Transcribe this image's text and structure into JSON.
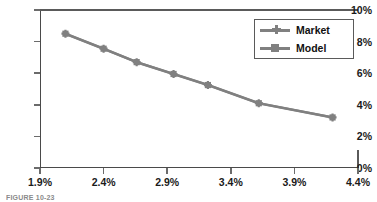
{
  "chart_data": {
    "type": "line",
    "title": "",
    "xlabel": "",
    "ylabel": "",
    "xlim": [
      1.9,
      4.4
    ],
    "ylim": [
      0,
      10
    ],
    "x_ticks": [
      "1.9%",
      "2.4%",
      "2.9%",
      "3.4%",
      "3.9%",
      "4.4%"
    ],
    "x_tick_values": [
      1.9,
      2.4,
      2.9,
      3.4,
      3.9,
      4.4
    ],
    "y_ticks": [
      "0%",
      "2%",
      "4%",
      "6%",
      "8%",
      "10%"
    ],
    "y_tick_values": [
      0,
      2,
      4,
      6,
      8,
      10
    ],
    "grid": false,
    "legend_position": "top-right",
    "x": [
      2.1,
      2.4,
      2.66,
      2.95,
      3.22,
      3.62,
      4.2
    ],
    "series": [
      {
        "name": "Market",
        "marker": "cross",
        "color": "#808080",
        "values": [
          8.5,
          7.55,
          6.7,
          5.95,
          5.25,
          4.1,
          3.2
        ]
      },
      {
        "name": "Model",
        "marker": "square",
        "color": "#808080",
        "values": [
          8.5,
          7.55,
          6.7,
          5.95,
          5.25,
          4.1,
          3.2
        ]
      }
    ]
  },
  "legend": {
    "entries": [
      {
        "label": "Market",
        "marker": "cross"
      },
      {
        "label": "Model",
        "marker": "square"
      }
    ]
  },
  "caption": {
    "text": "FIGURE 10-23"
  },
  "colors": {
    "series": "#808080",
    "axis": "#4a4a4a",
    "text": "#1a1a1a",
    "background": "#ffffff"
  }
}
